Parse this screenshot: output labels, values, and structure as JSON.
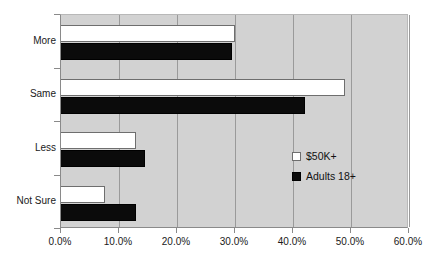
{
  "chart_data": {
    "type": "bar",
    "orientation": "horizontal",
    "title": "",
    "subtitle": "",
    "xlabel": "",
    "ylabel": "",
    "xlim": [
      0,
      60
    ],
    "xtick_labels": [
      "0.0%",
      "10.0%",
      "20.0%",
      "30.0%",
      "40.0%",
      "50.0%",
      "60.0%"
    ],
    "xtick_values": [
      0,
      10,
      20,
      30,
      40,
      50,
      60
    ],
    "grid": true,
    "grid_axis": "x",
    "legend_position": "center-right",
    "categories": [
      "More",
      "Same",
      "Less",
      "Not Sure"
    ],
    "series": [
      {
        "name": "$50K+",
        "color": "#ffffff",
        "values": [
          30.0,
          49.0,
          13.0,
          7.5
        ]
      },
      {
        "name": "Adults 18+",
        "color": "#0b0b0b",
        "values": [
          29.5,
          42.0,
          14.5,
          13.0
        ]
      }
    ]
  },
  "axes": {
    "x_ticks": [
      {
        "label": "0.0%",
        "value": 0
      },
      {
        "label": "10.0%",
        "value": 10
      },
      {
        "label": "20.0%",
        "value": 20
      },
      {
        "label": "30.0%",
        "value": 30
      },
      {
        "label": "40.0%",
        "value": 40
      },
      {
        "label": "50.0%",
        "value": 50
      },
      {
        "label": "60.0%",
        "value": 60
      }
    ],
    "y_categories": [
      {
        "label": "More"
      },
      {
        "label": "Same"
      },
      {
        "label": "Less"
      },
      {
        "label": "Not Sure"
      }
    ]
  },
  "legend": {
    "items": [
      {
        "label": "$50K+",
        "swatch": "light"
      },
      {
        "label": "Adults 18+",
        "swatch": "dark"
      }
    ]
  },
  "colors": {
    "plot_background": "#d2d2d2",
    "page_background": "#ffffff",
    "gridline": "#9a9a9a",
    "axis": "#8a8a8a",
    "series_light": "#ffffff",
    "series_dark": "#0b0b0b",
    "text": "#1a1a1a"
  }
}
